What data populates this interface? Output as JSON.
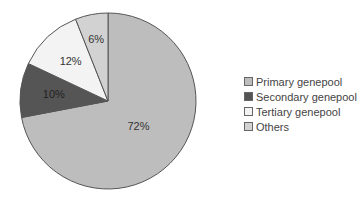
{
  "chart_data": {
    "type": "pie",
    "title": "",
    "categories": [
      "Primary genepool",
      "Secondary genepool",
      "Tertiary genepool",
      "Others"
    ],
    "values": [
      72,
      10,
      12,
      6
    ],
    "labels": [
      "72%",
      "10%",
      "12%",
      "6%"
    ],
    "colors": [
      "#bdbdbd",
      "#555555",
      "#f3f3f3",
      "#d2d2d2"
    ],
    "legend_position": "right"
  },
  "legend": {
    "items": [
      {
        "label": "Primary genepool",
        "color": "#bdbdbd"
      },
      {
        "label": "Secondary genepool",
        "color": "#555555"
      },
      {
        "label": "Tertiary genepool",
        "color": "#f3f3f3"
      },
      {
        "label": "Others",
        "color": "#d2d2d2"
      }
    ]
  }
}
